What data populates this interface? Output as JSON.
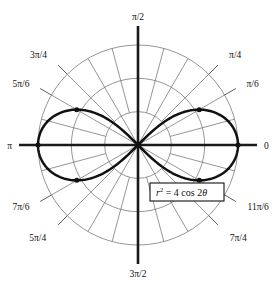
{
  "figure": {
    "kind": "polar-plot",
    "equation_label": {
      "full_text": "r² = 4 cos 2θ",
      "variable": "r",
      "exponent": "2",
      "relation": "=",
      "rhs": "4 cos 2",
      "theta": "θ"
    },
    "colors": {
      "curve": "#111111",
      "axis": "#1a1a1a",
      "grid": "#7a7a7a",
      "background": "#ffffff",
      "label_text": "#111111"
    }
  },
  "chart_data": {
    "type": "line",
    "coordinate_system": "polar",
    "title": "",
    "subtitle": "",
    "xlabel": "",
    "ylabel": "",
    "grid": true,
    "legend": "none",
    "equation": "r^2 = 4 cos 2theta",
    "curve_name": "lemniscate",
    "r_max": 2,
    "radial_rings": [
      0.667,
      1.333,
      2
    ],
    "angular_tick_step_deg": 15,
    "theta_range_deg": [
      0,
      360
    ],
    "angle_labels": [
      {
        "text": "0",
        "deg": 0
      },
      {
        "text": "π/6",
        "deg": 30
      },
      {
        "text": "π/4",
        "deg": 45
      },
      {
        "text": "π/2",
        "deg": 90
      },
      {
        "text": "3π/4",
        "deg": 135
      },
      {
        "text": "5π/6",
        "deg": 150
      },
      {
        "text": "π",
        "deg": 180
      },
      {
        "text": "7π/6",
        "deg": 210
      },
      {
        "text": "5π/4",
        "deg": 225
      },
      {
        "text": "3π/2",
        "deg": 270
      },
      {
        "text": "7π/4",
        "deg": 315
      },
      {
        "text": "11π/6",
        "deg": 330
      }
    ],
    "marked_points": [
      {
        "r": 2,
        "deg": 0
      },
      {
        "r": 2,
        "deg": 180
      },
      {
        "r": 1.414,
        "deg": 30
      },
      {
        "r": 1.414,
        "deg": 150
      },
      {
        "r": 1.414,
        "deg": 210
      },
      {
        "r": 1.414,
        "deg": 330
      }
    ],
    "series": [
      {
        "name": "r^2 = 4 cos 2theta",
        "theta_domain_deg": [
          [
            -45,
            45
          ],
          [
            135,
            225
          ]
        ],
        "r_formula": "sqrt(4*cos(2*theta))"
      }
    ]
  }
}
